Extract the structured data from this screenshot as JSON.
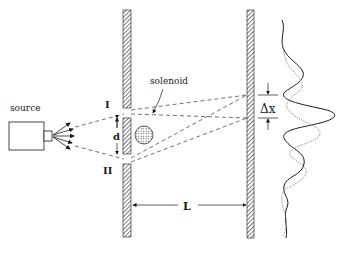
{
  "figure": {
    "labels": {
      "source": "source",
      "slit_1": "I",
      "slit_2": "II",
      "slit_separation": "d",
      "solenoid": "solenoid",
      "distance": "L",
      "fringe_shift": "Δx"
    },
    "colors": {
      "ink": "#1a1a1a",
      "hatch": "#555555",
      "dashed": "#333333",
      "shifted_pattern": "#8a8a8a",
      "solenoid_fill": "#d8d8d8"
    }
  }
}
